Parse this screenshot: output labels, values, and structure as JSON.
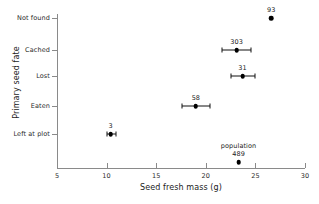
{
  "chart_data": {
    "type": "scatter",
    "title": "",
    "xlabel": "Seed fresh mass (g)",
    "ylabel": "Primary seed fate",
    "xlim": [
      5,
      30
    ],
    "xticks": [
      5,
      10,
      15,
      20,
      25,
      30
    ],
    "xticklabels": [
      "5",
      "10",
      "15",
      "20",
      "25",
      "30"
    ],
    "categories": [
      "Not found",
      "Cached",
      "Lost",
      "Eaten",
      "Left at plot"
    ],
    "grid": false,
    "legend": null,
    "error_bars": "horizontal, mean ± SE",
    "points": [
      {
        "category": "Not found",
        "x": 26.6,
        "n_label": "93",
        "err_low": null,
        "err_high": null
      },
      {
        "category": "Cached",
        "x": 23.1,
        "n_label": "303",
        "err_low": 21.6,
        "err_high": 24.6
      },
      {
        "category": "Lost",
        "x": 23.7,
        "n_label": "31",
        "err_low": 22.5,
        "err_high": 25.0
      },
      {
        "category": "Eaten",
        "x": 19.0,
        "n_label": "58",
        "err_low": 17.6,
        "err_high": 20.4
      },
      {
        "category": "Left at plot",
        "x": 10.4,
        "n_label": "3",
        "err_low": 10.0,
        "err_high": 10.9
      }
    ],
    "reference_point": {
      "group_label": "population",
      "n_label": "489",
      "x": 23.3
    },
    "colors": {
      "marker": "#000000",
      "axis": "#8a8a8a",
      "text": "#1a1a1a"
    }
  }
}
